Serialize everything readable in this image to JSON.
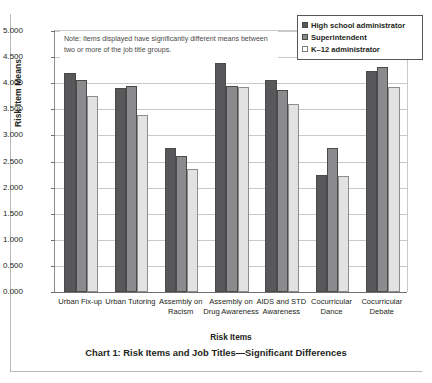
{
  "caption": "Chart 1: Risk Items and Job Titles—Significant Differences",
  "note": "Note: Items displayed have significantly different means between two or more of the job title groups.",
  "chart_data": {
    "type": "bar",
    "title": "Chart 1: Risk Items and Job Titles—Significant Differences",
    "xlabel": "Risk Items",
    "ylabel": "Risk Item Means",
    "ylim": [
      0,
      5
    ],
    "ytick_step": 0.5,
    "ytick_labels": [
      "0.000",
      "0.500",
      "1.000",
      "1.500",
      "2.000",
      "2.500",
      "3.000",
      "3.500",
      "4.000",
      "4.500",
      "5.000"
    ],
    "grid": true,
    "legend_position": "top-right",
    "annotation": "Note: Items displayed have significantly different means between two or more of the job title groups.",
    "categories": [
      "Urban Fix-up",
      "Urban Tutoring",
      "Assembly on Racism",
      "Assembly on Drug Awareness",
      "AIDS and STD Awareness",
      "Cocurricular Dance",
      "Cocurricular Debate"
    ],
    "series": [
      {
        "name": "High school administrator",
        "color": "#58585a",
        "values": [
          4.2,
          3.9,
          2.75,
          4.38,
          4.07,
          2.24,
          4.23
        ]
      },
      {
        "name": "Superintendent",
        "color": "#8b8b8d",
        "values": [
          4.06,
          3.94,
          2.6,
          3.94,
          3.87,
          2.76,
          4.31
        ]
      },
      {
        "name": "K–12 administrator",
        "color": "#e2e2e2",
        "values": [
          3.76,
          3.4,
          2.35,
          3.92,
          3.61,
          2.22,
          3.92
        ]
      }
    ]
  }
}
